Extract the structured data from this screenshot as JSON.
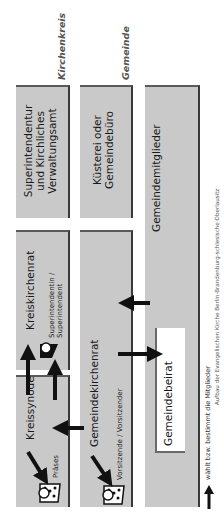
{
  "labels": {
    "kirchenkreis": "Kirchenkreis",
    "gemeinde": "Gemeinde"
  },
  "boxes": {
    "superintendentur": {
      "line1": "Superintendentur",
      "line2": "und Kirchliches",
      "line3": "Verwaltungsamt"
    },
    "kuesterei": {
      "line1": "Küsterei oder",
      "line2": "Gemeindebüro"
    },
    "gemeindemitglieder": {
      "title": "Gemeindemitglieder"
    },
    "kreiskirchenrat": {
      "title": "Kreiskirchenrat",
      "person_line1": "Superintendentin /",
      "person_line2": "Superintendent"
    },
    "kreissynode": {
      "title": "Kreissynode",
      "person": "Präses"
    },
    "gemeindekirchenrat": {
      "title": "Gemeindekirchenrat",
      "person": "Vorsitzende / Vorsitzender"
    },
    "gemeindebeirat": {
      "title": "Gemeindebeirat"
    }
  },
  "legend": {
    "text": "wählt bzw. bestimmt die Mitglieder",
    "icon": "arrow-up-icon"
  },
  "caption": "Aufbau der Evangelischen Kirche Berlin-Brandenburg-schlesische Oberlausitz",
  "colors": {
    "box_fill": "#c9c9c9",
    "border": "#3a3a3a",
    "arrow": "#111111"
  }
}
